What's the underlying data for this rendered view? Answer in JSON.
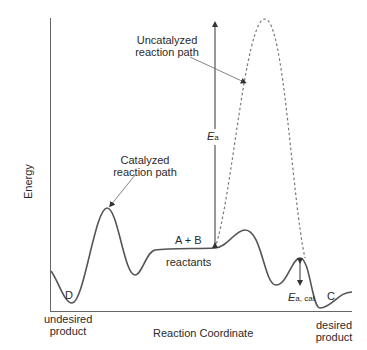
{
  "figure": {
    "y_axis_label": "Energy",
    "x_axis_label": "Reaction Coordinate",
    "labels": {
      "uncatalyzed_line1": "Uncatalyzed",
      "uncatalyzed_line2": "reaction path",
      "catalyzed_line1": "Catalyzed",
      "catalyzed_line2": "reaction path",
      "ea_main": "E",
      "ea_sub": "a",
      "ea_cat_main": "E",
      "ea_cat_sub": "a, cat",
      "reactant_species": "A + B",
      "reactants": "reactants",
      "point_d": "D",
      "point_c": "C",
      "undesired_line1": "undesired",
      "undesired_line2": "product",
      "desired_line1": "desired",
      "desired_line2": "product"
    },
    "colors": {
      "curve": "#555555",
      "axis": "#666666",
      "arrow": "#333333"
    }
  }
}
